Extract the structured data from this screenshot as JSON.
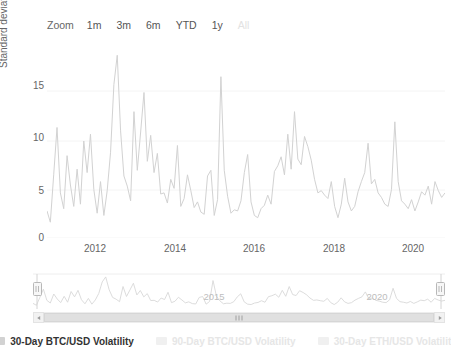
{
  "rangeselector": {
    "label": "Zoom",
    "buttons": [
      {
        "text": "1m",
        "selected": false
      },
      {
        "text": "3m",
        "selected": false
      },
      {
        "text": "6m",
        "selected": false
      },
      {
        "text": "YTD",
        "selected": false
      },
      {
        "text": "1y",
        "selected": false
      },
      {
        "text": "All",
        "selected": true
      }
    ]
  },
  "legend": {
    "items": [
      {
        "label": "30-Day BTC/USD Volatility",
        "color": "#d2d2d2",
        "visible": true
      },
      {
        "label": "90-Day BTC/USD Volatility",
        "color": "#f0f0f0",
        "visible": false
      },
      {
        "label": "30-Day ETH/USD Volatility",
        "color": "#f0f0f0",
        "visible": false
      }
    ]
  },
  "navigator": {
    "xlabels": [
      "2015",
      "2020"
    ],
    "left_handle": "navigator-left-handle",
    "right_handle": "navigator-right-handle"
  },
  "scrollbar": {
    "left_arrow": "scroll-left",
    "right_arrow": "scroll-right"
  },
  "chart_data": {
    "type": "line",
    "title": "",
    "xlabel": "",
    "ylabel": "Standard deviation of daily returns",
    "yticks": [
      0,
      5,
      10,
      15
    ],
    "ylim": [
      0,
      17.2
    ],
    "xticks": [
      "2012",
      "2014",
      "2016",
      "2018",
      "2020"
    ],
    "xlim": [
      "2011-07",
      "2021-06"
    ],
    "grid": true,
    "legend_position": "bottom",
    "line_color": "#d2d2d2",
    "series": [
      {
        "name": "30-Day BTC/USD Volatility",
        "visible": true,
        "x": [
          "2011-07",
          "2011-08",
          "2011-09",
          "2011-10",
          "2011-11",
          "2011-12",
          "2012-01",
          "2012-02",
          "2012-03",
          "2012-04",
          "2012-05",
          "2012-06",
          "2012-07",
          "2012-08",
          "2012-09",
          "2012-10",
          "2012-11",
          "2012-12",
          "2013-01",
          "2013-02",
          "2013-03",
          "2013-04",
          "2013-05",
          "2013-06",
          "2013-07",
          "2013-08",
          "2013-09",
          "2013-10",
          "2013-11",
          "2013-12",
          "2014-01",
          "2014-02",
          "2014-03",
          "2014-04",
          "2014-05",
          "2014-06",
          "2014-07",
          "2014-08",
          "2014-09",
          "2014-10",
          "2014-11",
          "2014-12",
          "2015-01",
          "2015-02",
          "2015-03",
          "2015-04",
          "2015-05",
          "2015-06",
          "2015-07",
          "2015-08",
          "2015-09",
          "2015-10",
          "2015-11",
          "2015-12",
          "2016-01",
          "2016-02",
          "2016-03",
          "2016-04",
          "2016-05",
          "2016-06",
          "2016-07",
          "2016-08",
          "2016-09",
          "2016-10",
          "2016-11",
          "2016-12",
          "2017-01",
          "2017-02",
          "2017-03",
          "2017-04",
          "2017-05",
          "2017-06",
          "2017-07",
          "2017-08",
          "2017-09",
          "2017-10",
          "2017-11",
          "2017-12",
          "2018-01",
          "2018-02",
          "2018-03",
          "2018-04",
          "2018-05",
          "2018-06",
          "2018-07",
          "2018-08",
          "2018-09",
          "2018-10",
          "2018-11",
          "2018-12",
          "2019-01",
          "2019-02",
          "2019-03",
          "2019-04",
          "2019-05",
          "2019-06",
          "2019-07",
          "2019-08",
          "2019-09",
          "2019-10",
          "2019-11",
          "2019-12",
          "2020-01",
          "2020-02",
          "2020-03",
          "2020-04",
          "2020-05",
          "2020-06",
          "2020-07",
          "2020-08",
          "2020-09",
          "2020-10",
          "2020-11",
          "2020-12",
          "2021-01",
          "2021-02",
          "2021-03",
          "2021-04",
          "2021-05",
          "2021-06"
        ],
        "values": [
          2.4,
          1.4,
          5.6,
          9.8,
          4.0,
          2.6,
          7.3,
          4.7,
          2.8,
          6.1,
          3.0,
          8.6,
          5.8,
          9.2,
          4.3,
          2.2,
          5.0,
          2.0,
          4.2,
          7.6,
          13.6,
          16.2,
          9.5,
          5.5,
          4.6,
          3.3,
          11.2,
          6.0,
          9.4,
          12.9,
          6.8,
          9.1,
          5.8,
          7.5,
          3.9,
          4.0,
          3.1,
          5.2,
          4.4,
          8.2,
          2.8,
          3.5,
          5.6,
          4.2,
          2.7,
          3.2,
          2.3,
          2.1,
          5.5,
          6.0,
          2.0,
          3.4,
          14.3,
          6.0,
          3.7,
          2.2,
          2.5,
          2.4,
          3.3,
          5.8,
          7.4,
          3.2,
          2.0,
          1.8,
          2.6,
          2.9,
          3.8,
          3.0,
          5.9,
          6.4,
          7.2,
          5.6,
          9.2,
          6.1,
          11.2,
          7.0,
          6.5,
          9.0,
          8.1,
          6.9,
          5.2,
          4.0,
          4.2,
          3.8,
          3.5,
          5.0,
          2.8,
          1.8,
          3.0,
          5.3,
          3.2,
          2.4,
          2.8,
          4.1,
          5.0,
          5.8,
          8.4,
          4.8,
          5.2,
          4.0,
          3.6,
          3.0,
          2.8,
          4.3,
          10.3,
          5.0,
          3.3,
          3.0,
          2.6,
          3.4,
          2.4,
          3.2,
          4.1,
          3.8,
          4.6,
          3.0,
          5.0,
          4.2,
          3.6,
          4.0
        ]
      },
      {
        "name": "90-Day BTC/USD Volatility",
        "visible": false,
        "values": []
      },
      {
        "name": "30-Day ETH/USD Volatility",
        "visible": false,
        "values": []
      }
    ]
  }
}
